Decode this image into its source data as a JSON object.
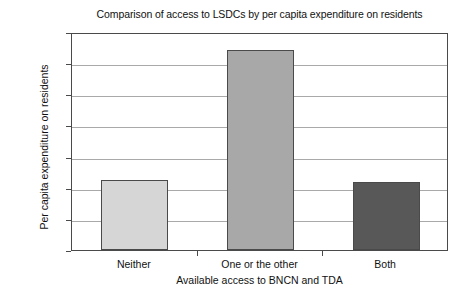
{
  "chart_data": {
    "type": "bar",
    "title": "Comparison of access to LSDCs by per capita expenditure on residents",
    "xlabel": "Available access to BNCN and TDA",
    "ylabel": "Per capita expenditure on residents",
    "categories": [
      "Neither",
      "One or the other",
      "Both"
    ],
    "values": [
      17.13,
      19.21,
      17.1
    ],
    "ylim": [
      16.0,
      19.5
    ],
    "ytick_labels": [
      "£19.50",
      "£19.00",
      "£18.50",
      "£18.00",
      "£17.50",
      "£17.00",
      "£16.50",
      "£16.00"
    ],
    "ytick_values": [
      19.5,
      19.0,
      18.5,
      18.0,
      17.5,
      17.0,
      16.5,
      16.0
    ],
    "grid": true,
    "legend": false,
    "bar_colors": [
      "#d6d6d6",
      "#a8a8a8",
      "#585858"
    ],
    "bar_border_color": "#4a4a4a",
    "gridline_color": "#a9a9a9",
    "plot_background": "#ffffff",
    "series": [
      {
        "name": "Per capita expenditure on residents",
        "values": [
          17.13,
          19.21,
          17.1
        ]
      }
    ]
  }
}
